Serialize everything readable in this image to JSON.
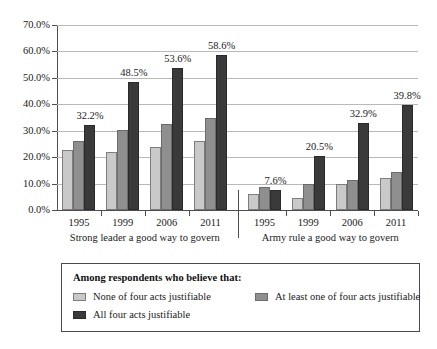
{
  "chart_data": {
    "type": "bar",
    "title": "",
    "subtitle": "",
    "xlabel": "",
    "ylabel": "",
    "ylim": [
      0,
      70
    ],
    "y_tick_labels": [
      "0.0%",
      "10.0%",
      "20.0%",
      "30.0%",
      "40.0%",
      "50.0%",
      "60.0%",
      "70.0%"
    ],
    "y_tick_values": [
      0,
      10,
      20,
      30,
      40,
      50,
      60,
      70
    ],
    "grid": true,
    "legend_position": "bottom",
    "categories": [
      "1995",
      "1999",
      "2006",
      "2011"
    ],
    "groups": [
      {
        "caption": "Strong leader a good way to govern",
        "categories": [
          "1995",
          "1999",
          "2006",
          "2011"
        ],
        "series": [
          {
            "name": "None of four acts justifiable",
            "values": [
              22.7,
              21.9,
              23.7,
              26.0
            ]
          },
          {
            "name": "At least one of four acts justifiable",
            "values": [
              26.0,
              30.2,
              32.5,
              34.8
            ]
          },
          {
            "name": "All four acts justifiable",
            "values": [
              32.2,
              48.5,
              53.6,
              58.6
            ]
          }
        ],
        "labels": [
          "32.2%",
          "48.5%",
          "53.6%",
          "58.6%"
        ]
      },
      {
        "caption": "Army rule a good way to govern",
        "categories": [
          "1995",
          "1999",
          "2006",
          "2011"
        ],
        "series": [
          {
            "name": "None of four acts justifiable",
            "values": [
              6.2,
              4.6,
              9.8,
              12.0
            ]
          },
          {
            "name": "At least one of four acts justifiable",
            "values": [
              8.8,
              9.8,
              11.2,
              14.2
            ]
          },
          {
            "name": "All four acts justifiable",
            "values": [
              7.6,
              20.5,
              32.9,
              39.8
            ]
          }
        ],
        "labels": [
          "7.6%",
          "20.5%",
          "32.9%",
          "39.8%"
        ]
      }
    ],
    "annotations": [
      "32.2%",
      "48.5%",
      "53.6%",
      "58.6%",
      "7.6%",
      "20.5%",
      "32.9%",
      "39.8%"
    ],
    "colors": {
      "series_none": "#c9c9c9",
      "series_at_least_one": "#8f8f8f",
      "series_all_four": "#3a3a3a",
      "gridline": "#b9b9b9",
      "axis": "#4d4d4d",
      "text": "#1a1a1a",
      "background": "#ffffff"
    }
  },
  "legend": {
    "title": "Among respondents who believe that:",
    "entries": [
      {
        "label": "None of four acts justifiable",
        "swatch": "series_none"
      },
      {
        "label": "At least one of four acts justifiable",
        "swatch": "series_at_least_one"
      },
      {
        "label": "All four acts justifiable",
        "swatch": "series_all_four"
      }
    ]
  }
}
